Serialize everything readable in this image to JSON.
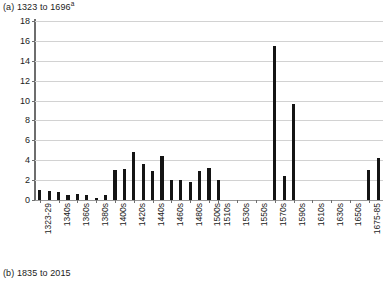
{
  "figure": {
    "caption_a_prefix": "(a) 1323 to 1696",
    "caption_a_superscript": "a",
    "caption_b": "(b) 1835 to 2015"
  },
  "chart_data": {
    "type": "bar",
    "title": "(a) 1323 to 1696a",
    "xlabel": "",
    "ylabel": "",
    "ylim": [
      0,
      18
    ],
    "ytick_labels": [
      "0",
      "2",
      "4",
      "6",
      "8",
      "10",
      "12",
      "14",
      "16",
      "18"
    ],
    "ytick_values": [
      0,
      2,
      4,
      6,
      8,
      10,
      12,
      14,
      16,
      18
    ],
    "grid": true,
    "legend": "none",
    "bar_color": "#141414",
    "grid_color": "#d2d2d2",
    "axis_color": "#6e6e6e",
    "categories": [
      "1323-29",
      "1330s",
      "1340s",
      "1350s",
      "1360s",
      "1370s",
      "1380s",
      "1390s",
      "1400s",
      "1410s",
      "1420s",
      "1430s",
      "1440s",
      "1450s",
      "1460s",
      "1470s",
      "1480s",
      "1490s",
      "1500s",
      "1510s",
      "1520s",
      "1530s",
      "1540s",
      "1550s",
      "1560s",
      "1570s",
      "1580s",
      "1590s",
      "1600s",
      "1610s",
      "1620s",
      "1630s",
      "1640s",
      "1650s",
      "1660s",
      "1675-85",
      "1686-96"
    ],
    "values": [
      1,
      0.9,
      0.8,
      0.5,
      0.6,
      0.5,
      0.2,
      0.5,
      3,
      3.1,
      4.8,
      3.6,
      2.9,
      4.4,
      2,
      2,
      1.8,
      2.9,
      3.2,
      2,
      0,
      0,
      0,
      0,
      0,
      15.5,
      2.4,
      9.7,
      0,
      0,
      0,
      0,
      0,
      0,
      0,
      3,
      4.2
    ],
    "tick_label_categories": [
      "1323-29",
      "1340s",
      "1360s",
      "1380s",
      "1400s",
      "1420s",
      "1440s",
      "1460s",
      "1480s",
      "1500s",
      "1510s",
      "1530s",
      "1550s",
      "1570s",
      "1590s",
      "1610s",
      "1630s",
      "1650s",
      "1675-85"
    ],
    "tick_label_indices": [
      0,
      2,
      4,
      6,
      8,
      10,
      12,
      14,
      16,
      18,
      19,
      21,
      23,
      25,
      27,
      29,
      31,
      33,
      35
    ]
  }
}
